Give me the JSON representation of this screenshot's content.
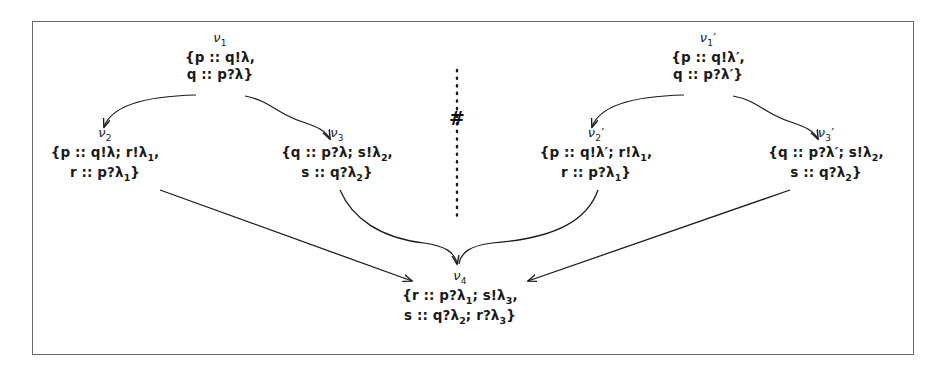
{
  "figure": {
    "type": "transition-graph-pair",
    "divider": {
      "symbol": "#",
      "style": "vertical-dotted-line"
    }
  },
  "nodes": {
    "v1": {
      "label": "ν",
      "sub": "1",
      "prime": "",
      "line1": "{p :: q!λ,",
      "line2": "q :: p?λ}"
    },
    "v2": {
      "label": "ν",
      "sub": "2",
      "prime": "",
      "line1": "{p :: q!λ; r!λ",
      "line1sub": "1",
      "line1tail": ",",
      "line2": "r :: p?λ",
      "line2sub": "1",
      "line2tail": "}"
    },
    "v3": {
      "label": "ν",
      "sub": "3",
      "prime": "",
      "line1": "{q :: p?λ; s!λ",
      "line1sub": "2",
      "line1tail": ",",
      "line2": "s :: q?λ",
      "line2sub": "2",
      "line2tail": "}"
    },
    "v1p": {
      "label": "ν",
      "sub": "1",
      "prime": "′",
      "line1": "{p :: q!λ′,",
      "line2": "q :: p?λ′}"
    },
    "v2p": {
      "label": "ν",
      "sub": "2",
      "prime": "′",
      "line1": "{p :: q!λ′; r!λ",
      "line1sub": "1",
      "line1tail": ",",
      "line2": "r :: p?λ",
      "line2sub": "1",
      "line2tail": "}"
    },
    "v3p": {
      "label": "ν",
      "sub": "3",
      "prime": "′",
      "line1": "{q :: p?λ′; s!λ",
      "line1sub": "2",
      "line1tail": ",",
      "line2": "s :: q?λ",
      "line2sub": "2",
      "line2tail": "}"
    },
    "v4": {
      "label": "ν",
      "sub": "4",
      "prime": "",
      "line1": "{r :: p?λ",
      "line1sub": "1",
      "line1mid": "; s!λ",
      "line1sub2": "3",
      "line1tail": ",",
      "line2": "s :: q?λ",
      "line2sub": "2",
      "line2mid": "; r?λ",
      "line2sub2": "3",
      "line2tail": "}"
    }
  },
  "edges": [
    {
      "from": "v1",
      "to": "v2",
      "shape": "curve-left"
    },
    {
      "from": "v1",
      "to": "v3",
      "shape": "curve-right"
    },
    {
      "from": "v1p",
      "to": "v2p",
      "shape": "curve-left"
    },
    {
      "from": "v1p",
      "to": "v3p",
      "shape": "curve-right"
    },
    {
      "from": "v2",
      "to": "v4",
      "shape": "straight-diagonal"
    },
    {
      "from": "v3",
      "to": "v4",
      "shape": "curve-converge"
    },
    {
      "from": "v2p",
      "to": "v4",
      "shape": "curve-converge"
    },
    {
      "from": "v3p",
      "to": "v4",
      "shape": "straight-diagonal"
    }
  ],
  "colors": {
    "ink": "#1a1a1a",
    "frame": "#6b6b6b",
    "background": "#ffffff"
  }
}
